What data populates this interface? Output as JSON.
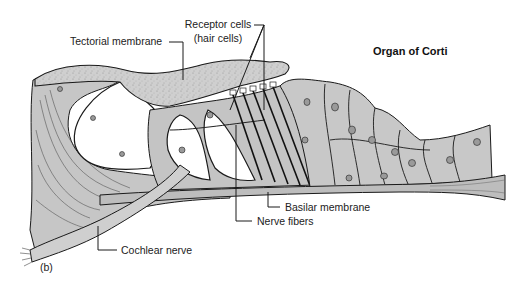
{
  "figure": {
    "title": "Organ of Corti",
    "panel_label": "(b)",
    "colors": {
      "tissue_fill": "#c9c9c9",
      "tissue_light": "#d8d8d8",
      "outline": "#1a1a1a",
      "background": "#ffffff"
    }
  },
  "labels": {
    "tectorial_membrane": "Tectorial membrane",
    "receptor_cells_line1": "Receptor cells",
    "receptor_cells_line2": "(hair cells)",
    "basilar_membrane": "Basilar membrane",
    "nerve_fibers": "Nerve fibers",
    "cochlear_nerve": "Cochlear nerve"
  }
}
